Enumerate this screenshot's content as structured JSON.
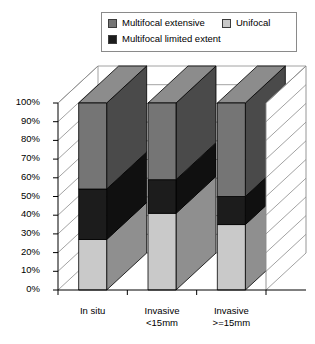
{
  "legend": {
    "items": [
      {
        "label": "Multifocal extensive",
        "key": "extensive",
        "color": "#757575",
        "swatch_name": "legend-swatch-multifocal-extensive"
      },
      {
        "label": "Multifocal limited extent",
        "key": "limited",
        "color": "#1c1c1c",
        "swatch_name": "legend-swatch-multifocal-limited-extent"
      },
      {
        "label": "Unifocal",
        "key": "unifocal",
        "color": "#c9c9c9",
        "swatch_name": "legend-swatch-unifocal"
      }
    ]
  },
  "axis": {
    "y_ticks": [
      "100%",
      "90%",
      "80%",
      "70%",
      "60%",
      "50%",
      "40%",
      "30%",
      "20%",
      "10%",
      "0%"
    ],
    "y_min": 0,
    "y_max": 100
  },
  "chart_data": {
    "type": "bar",
    "title": "",
    "subtitle": "",
    "xlabel": "",
    "ylabel": "",
    "ylim": [
      0,
      100
    ],
    "stacked": true,
    "percent_stacked": true,
    "three_d": true,
    "grid": true,
    "legend_position": "top",
    "categories": [
      "In situ",
      "Invasive <15mm",
      "Invasive >=15mm"
    ],
    "category_lines": [
      [
        "In situ"
      ],
      [
        "Invasive",
        "<15mm"
      ],
      [
        "Invasive",
        ">=15mm"
      ]
    ],
    "y_tick_labels": [
      "0%",
      "10%",
      "20%",
      "30%",
      "40%",
      "50%",
      "60%",
      "70%",
      "80%",
      "90%",
      "100%"
    ],
    "series": [
      {
        "name": "Unifocal",
        "color": "#c9c9c9",
        "values": [
          27,
          41,
          35
        ]
      },
      {
        "name": "Multifocal limited extent",
        "color": "#1c1c1c",
        "values": [
          27,
          18,
          15
        ]
      },
      {
        "name": "Multifocal extensive",
        "color": "#757575",
        "values": [
          46,
          41,
          50
        ]
      }
    ],
    "stack_order_bottom_to_top": [
      "Unifocal",
      "Multifocal limited extent",
      "Multifocal extensive"
    ]
  },
  "colors": {
    "unifocal_front": "#c9c9c9",
    "unifocal_side": "#8f8f8f",
    "unifocal_top": "#e0e0e0",
    "limited_front": "#1c1c1c",
    "limited_side": "#101010",
    "limited_top": "#2e2e2e",
    "extensive_front": "#757575",
    "extensive_side": "#4a4a4a",
    "extensive_top": "#8c8c8c",
    "wall_back": "#ffffff",
    "wall_side": "#ffffff",
    "floor": "#ffffff",
    "grid_line": "#8a8a8a",
    "axis_line": "#000000"
  }
}
